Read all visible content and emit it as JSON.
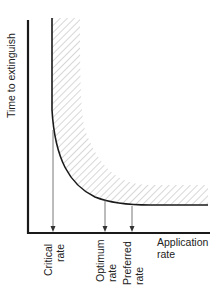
{
  "diagram": {
    "y_axis_label": "Time to extinguish",
    "x_axis_label_line1": "Application",
    "x_axis_label_line2": "rate",
    "markers": [
      {
        "line1": "Critical",
        "line2": "rate"
      },
      {
        "line1": "Optimum",
        "line2": "rate"
      },
      {
        "line1": "Preferred",
        "line2": "rate"
      }
    ],
    "colors": {
      "line": "#1a1a1a",
      "hatch": "#9a9a9a",
      "arrow": "#555555"
    }
  }
}
